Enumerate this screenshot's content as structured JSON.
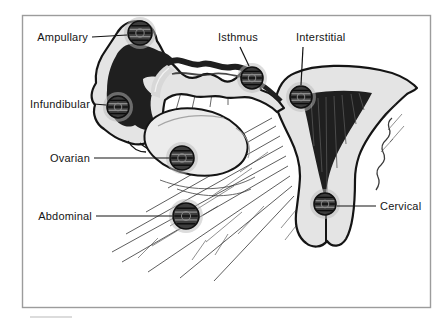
{
  "figure": {
    "kind": "ectopic-pregnancy-implantation-sites-illustration"
  },
  "sites": [
    {
      "id": "ampullary",
      "label": "Ampullary",
      "mass": {
        "x": 140,
        "y": 33,
        "r": 12
      },
      "leader": {
        "x1": 92,
        "y1": 37,
        "x2": 127,
        "y2": 35
      },
      "text": {
        "x": 88,
        "y": 41,
        "anchor": "end"
      }
    },
    {
      "id": "infundibular",
      "label": "Infundibular",
      "mass": {
        "x": 118,
        "y": 107,
        "r": 11
      },
      "leader": {
        "x1": 94,
        "y1": 104,
        "x2": 106,
        "y2": 105
      },
      "text": {
        "x": 90,
        "y": 108,
        "anchor": "end"
      }
    },
    {
      "id": "ovarian",
      "label": "Ovarian",
      "mass": {
        "x": 182,
        "y": 158,
        "r": 12
      },
      "leader": {
        "x1": 94,
        "y1": 158,
        "x2": 169,
        "y2": 158
      },
      "text": {
        "x": 90,
        "y": 162,
        "anchor": "end"
      }
    },
    {
      "id": "abdominal",
      "label": "Abdominal",
      "mass": {
        "x": 186,
        "y": 216,
        "r": 13
      },
      "leader": {
        "x1": 96,
        "y1": 216,
        "x2": 172,
        "y2": 216
      },
      "text": {
        "x": 92,
        "y": 220,
        "anchor": "end"
      }
    },
    {
      "id": "isthmus",
      "label": "Isthmus",
      "mass": {
        "x": 252,
        "y": 78,
        "r": 11
      },
      "leader": {
        "x1": 240,
        "y1": 47,
        "x2": 249,
        "y2": 66
      },
      "text": {
        "x": 218,
        "y": 41,
        "anchor": "start"
      }
    },
    {
      "id": "interstitial",
      "label": "Interstitial",
      "mass": {
        "x": 301,
        "y": 97,
        "r": 11
      },
      "leader": {
        "x1": 303,
        "y1": 47,
        "x2": 301,
        "y2": 85
      },
      "text": {
        "x": 296,
        "y": 41,
        "anchor": "start"
      }
    },
    {
      "id": "cervical",
      "label": "Cervical",
      "mass": {
        "x": 325,
        "y": 204,
        "r": 11
      },
      "leader": {
        "x1": 337,
        "y1": 206,
        "x2": 376,
        "y2": 206
      },
      "text": {
        "x": 380,
        "y": 210,
        "anchor": "start"
      }
    }
  ],
  "colors": {
    "page_background": "#ffffff",
    "frame_border": "#9c9c9c",
    "line_art": "#141414",
    "tissue_fill": "#e4e4e4",
    "ovary_fill": "#ececec",
    "cavity_fill": "#1f1f1f",
    "mass_fill": "#3d3d3d",
    "mass_halo": "#b9b9b9",
    "label_text": "#151515"
  }
}
